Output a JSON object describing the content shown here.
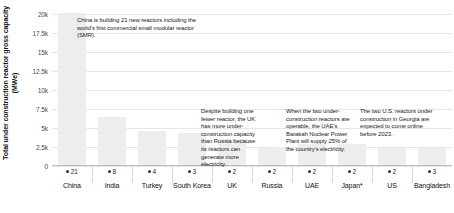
{
  "chart_data": {
    "type": "bar",
    "title": "",
    "xlabel": "",
    "ylabel": "Total under construction reactor gross capacity (MWe)",
    "ylim": [
      0,
      20000
    ],
    "grid": true,
    "legend": false,
    "tick_labels": [
      "0",
      "2.5k",
      "5k",
      "7.5k",
      "10k",
      "12.5k",
      "15k",
      "17.5k",
      "20k"
    ],
    "tick_values": [
      0,
      2500,
      5000,
      7500,
      10000,
      12500,
      15000,
      17500,
      20000
    ],
    "categories": [
      "China",
      "India",
      "Turkey",
      "South Korea",
      "UK",
      "Russia",
      "UAE",
      "Japan*",
      "US",
      "Bangladesh"
    ],
    "values": [
      21000,
      6300,
      4500,
      4200,
      3400,
      2400,
      2800,
      2700,
      2300,
      2400
    ],
    "reactor_counts": [
      21,
      8,
      4,
      3,
      2,
      2,
      2,
      2,
      2,
      3
    ],
    "annotations": [
      "China is building 21 new reactors including the world's first commercial small modular reactor (SMR).",
      "Despite building one fewer reactor, the UK has more under-construction capacity than Russia because its reactors can generate more electricity.",
      "When the two under-construction reactors are operable, the UAE's Barakah Nuclear Power Plant will supply 25% of the country's electricity.",
      "The two U.S. reactors under construction in Georgia are expected to come online before 2023."
    ]
  },
  "colors": {
    "bar": "#ededed",
    "gridline": "#e6e6e6",
    "axis": "#bdbdbd",
    "text": "#1a1a1a"
  }
}
